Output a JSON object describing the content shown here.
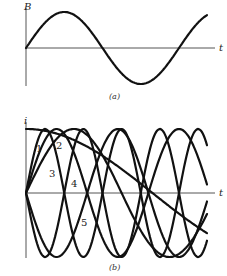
{
  "panel_a": {
    "y_axis_label": "B",
    "x_axis_label": "t",
    "caption": "(a)",
    "curve": {
      "name": "B",
      "shape": "sine",
      "phase_deg": 0,
      "cycles_shown": 1.3
    }
  },
  "panel_b": {
    "y_axis_label": "i",
    "x_axis_label": "t",
    "caption": "(b)",
    "curves": [
      {
        "label": "1",
        "shape": "sine",
        "phase_deg": 0,
        "relative_period": 1.0
      },
      {
        "label": "2",
        "shape": "sine",
        "phase_deg": 0,
        "relative_period": 1.6
      },
      {
        "label": "3",
        "shape": "sine",
        "phase_deg": 0,
        "relative_period": 2.5
      },
      {
        "label": "4",
        "shape": "sine",
        "phase_deg": 180,
        "relative_period": 1.0
      },
      {
        "label": "5",
        "shape": "sine",
        "phase_deg": 180,
        "relative_period": 1.6
      },
      {
        "label": "",
        "shape": "cosine",
        "phase_deg": 90,
        "relative_period": 4.0
      }
    ]
  }
}
